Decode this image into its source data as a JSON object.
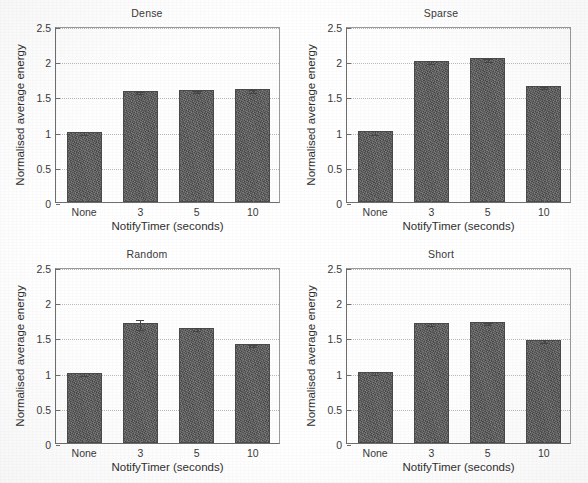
{
  "figure": {
    "background": "#ffffff",
    "bar_color": "#5b5b5b",
    "grid_color": "#b9b9b9",
    "axis_color": "#6e6e6e"
  },
  "chart_data": [
    {
      "type": "bar",
      "title": "Dense",
      "xlabel": "NotifyTimer (seconds)",
      "ylabel": "Normalised average energy",
      "categories": [
        "None",
        "3",
        "5",
        "10"
      ],
      "values": [
        1.0,
        1.58,
        1.59,
        1.6
      ],
      "errors": [
        0.02,
        0.015,
        0.02,
        0.02
      ],
      "ylim": [
        0,
        2.5
      ],
      "yticks": [
        0,
        0.5,
        1,
        1.5,
        2,
        2.5
      ],
      "ytick_labels": [
        "0",
        "0.5",
        "1",
        "1.5",
        "2",
        "2.5"
      ],
      "grid": true,
      "legend": "none"
    },
    {
      "type": "bar",
      "title": "Sparse",
      "xlabel": "NotifyTimer (seconds)",
      "ylabel": "Normalised average energy",
      "categories": [
        "None",
        "3",
        "5",
        "10"
      ],
      "values": [
        1.01,
        2.01,
        2.04,
        1.65
      ],
      "errors": [
        0.03,
        0.015,
        0.025,
        0.015
      ],
      "ylim": [
        0,
        2.5
      ],
      "yticks": [
        0,
        0.5,
        1,
        1.5,
        2,
        2.5
      ],
      "ytick_labels": [
        "0",
        "0.5",
        "1",
        "1.5",
        "2",
        "2.5"
      ],
      "grid": true,
      "legend": "none"
    },
    {
      "type": "bar",
      "title": "Random",
      "xlabel": "NotifyTimer (seconds)",
      "ylabel": "Normalised average energy",
      "categories": [
        "None",
        "3",
        "5",
        "10"
      ],
      "values": [
        1.0,
        1.71,
        1.64,
        1.4
      ],
      "errors": [
        0.02,
        0.07,
        0.015,
        0.015
      ],
      "ylim": [
        0,
        2.5
      ],
      "yticks": [
        0,
        0.5,
        1,
        1.5,
        2,
        2.5
      ],
      "ytick_labels": [
        "0",
        "0.5",
        "1",
        "1.5",
        "2",
        "2.5"
      ],
      "grid": true,
      "legend": "none"
    },
    {
      "type": "bar",
      "title": "Short",
      "xlabel": "NotifyTimer (seconds)",
      "ylabel": "Normalised average energy",
      "categories": [
        "None",
        "3",
        "5",
        "10"
      ],
      "values": [
        1.01,
        1.71,
        1.72,
        1.47
      ],
      "errors": [
        0.02,
        0.025,
        0.02,
        0.015
      ],
      "ylim": [
        0,
        2.5
      ],
      "yticks": [
        0,
        0.5,
        1,
        1.5,
        2,
        2.5
      ],
      "ytick_labels": [
        "0",
        "0.5",
        "1",
        "1.5",
        "2",
        "2.5"
      ],
      "grid": true,
      "legend": "none"
    }
  ]
}
